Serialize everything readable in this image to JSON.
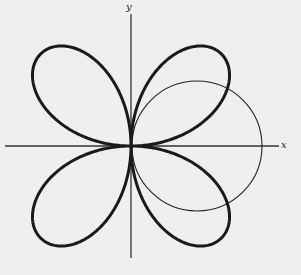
{
  "figure": {
    "axis_labels": {
      "x": "x",
      "y": "y"
    },
    "rose": {
      "equation_form": "r = a sin 2θ",
      "petals": 4
    },
    "circle": {
      "equation_form": "r = b cos θ"
    },
    "colors": {
      "background": "#efefef",
      "ink": "#1a1a1a"
    }
  }
}
